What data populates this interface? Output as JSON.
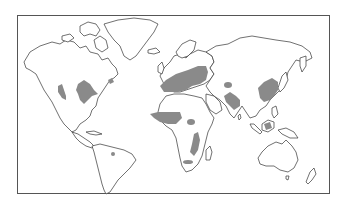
{
  "map": {
    "type": "world-outline-thematic",
    "frame": {
      "x": 17,
      "y": 15,
      "width": 313,
      "height": 179,
      "border_color": "#555555"
    },
    "colors": {
      "land_fill": "#ffffff",
      "coastline": "#333333",
      "shaded_region": "#8a8a8a",
      "background": "#ffffff"
    },
    "legend": null,
    "title": null,
    "shaded_regions": [
      "western-north-america-coast",
      "central-united-states",
      "northeastern-united-states",
      "paraguay-region",
      "europe-mediterranean",
      "sahel-west-africa",
      "east-africa",
      "southeastern-africa",
      "central-asia-spot",
      "northern-india",
      "eastern-china",
      "borneo-indonesia"
    ]
  }
}
